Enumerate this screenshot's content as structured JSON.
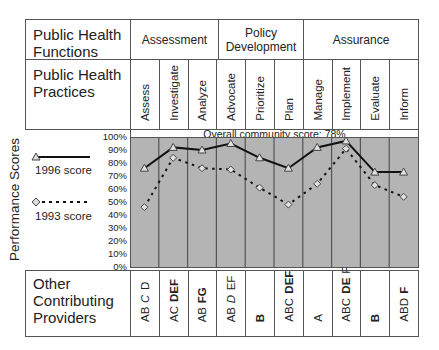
{
  "header": {
    "functions_label": "Public Health Functions",
    "practices_label": "Public Health Practices",
    "providers_label": "Other Contributing Providers",
    "y_axis_title": "Performance Scores",
    "overall_score_text": "Overall community score: 78%"
  },
  "functions": [
    {
      "label": "Assessment",
      "span": 3
    },
    {
      "label": "Policy Development",
      "span": 3
    },
    {
      "label": "Assurance",
      "span": 4
    }
  ],
  "practices": [
    "Assess",
    "Investigate",
    "Analyze",
    "Advocate",
    "Prioritize",
    "Plan",
    "Manage",
    "Implement",
    "Evaluate",
    "Inform"
  ],
  "providers": [
    [
      {
        "t": "AB"
      },
      {
        "t": "C",
        "s": "i"
      },
      {
        "t": "D"
      }
    ],
    [
      {
        "t": "AC"
      },
      {
        "t": "DEF",
        "s": "b"
      }
    ],
    [
      {
        "t": "AB"
      },
      {
        "t": "FG",
        "s": "b"
      }
    ],
    [
      {
        "t": "AB"
      },
      {
        "t": "D",
        "s": "i"
      },
      {
        "t": "EF"
      }
    ],
    [
      {
        "t": "B",
        "s": "b"
      }
    ],
    [
      {
        "t": "ABC"
      },
      {
        "t": "DEF",
        "s": "b"
      }
    ],
    [
      {
        "t": "A"
      }
    ],
    [
      {
        "t": "ABC"
      },
      {
        "t": "DE",
        "s": "b"
      },
      {
        "t": "F"
      }
    ],
    [
      {
        "t": "B",
        "s": "b"
      }
    ],
    [
      {
        "t": "ABD"
      },
      {
        "t": "F",
        "s": "b"
      }
    ]
  ],
  "legend": [
    {
      "label": "1996 score",
      "marker": "triangle-icon",
      "line": "solid"
    },
    {
      "label": "1993 score",
      "marker": "diamond-icon",
      "line": "dotted"
    }
  ],
  "colors": {
    "plot_bg": "#b4b4b4",
    "grid": "#555555",
    "series_1996": "#111111",
    "series_1993": "#111111"
  },
  "chart_data": {
    "type": "line",
    "title": "Overall community score: 78%",
    "xlabel": "Public Health Practices",
    "ylabel": "Performance Scores",
    "categories": [
      "Assess",
      "Investigate",
      "Analyze",
      "Advocate",
      "Prioritize",
      "Plan",
      "Manage",
      "Implement",
      "Evaluate",
      "Inform"
    ],
    "series": [
      {
        "name": "1996 score",
        "marker": "triangle",
        "style": "solid",
        "values": [
          76,
          92,
          90,
          95,
          84,
          76,
          92,
          97,
          73,
          73
        ]
      },
      {
        "name": "1993 score",
        "marker": "diamond",
        "style": "dotted",
        "values": [
          46,
          84,
          76,
          75,
          61,
          48,
          64,
          91,
          63,
          54
        ]
      }
    ],
    "yticks": [
      "100%",
      "90%",
      "80%",
      "70%",
      "60%",
      "50%",
      "40%",
      "30%",
      "20%",
      "10%",
      "0%"
    ],
    "ylim": [
      0,
      100
    ],
    "grid": "vertical column dividers",
    "legend_position": "left"
  }
}
